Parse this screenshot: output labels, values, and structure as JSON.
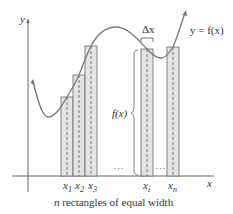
{
  "diagram": {
    "axes": {
      "x_label": "x",
      "y_label": "y"
    },
    "curve_label": "y = f(x)",
    "delta_label": "Δx",
    "height_label": "f(x)",
    "ellipsis": "…",
    "tick_labels": [
      {
        "base": "x",
        "sub": "1"
      },
      {
        "base": "x",
        "sub": "2"
      },
      {
        "base": "x",
        "sub": "3"
      },
      {
        "base": "x",
        "sub": "i"
      },
      {
        "base": "x",
        "sub": "n"
      }
    ],
    "caption": {
      "italic": "n",
      "rest": " rectangles of equal width"
    },
    "colors": {
      "rect_fill": "#e4e4e4",
      "stroke": "#555555",
      "curve": "#666666"
    }
  }
}
